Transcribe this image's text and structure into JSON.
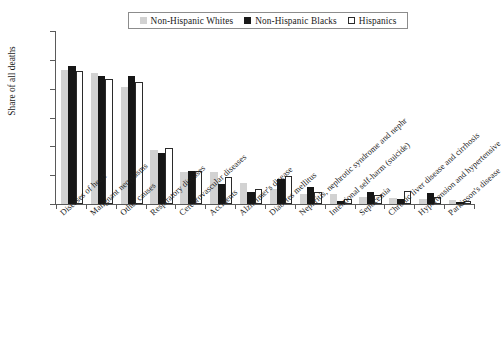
{
  "chart_data": {
    "type": "bar",
    "title": "",
    "xlabel": "",
    "ylabel": "Share of all deaths",
    "ylim": [
      0,
      0.3
    ],
    "yticks": [
      0,
      0.05,
      0.1,
      0.15,
      0.2,
      0.25,
      0.3
    ],
    "ytick_labels": [
      "0",
      "0.05",
      "0.1",
      "0.15",
      "0.2",
      "0.25",
      "0.3"
    ],
    "grid": false,
    "legend_position": "top-center",
    "categories": [
      "Diseases of heart",
      "Malignant neoplasms",
      "Other causes",
      "Respiratory diseases",
      "Cerebrovascular diseases",
      "Accidents",
      "Alzheimer's disease",
      "Diabetes mellitus",
      "Nephritis, nephrotic syndrome and nephr",
      "Intentional self-harm (suicide)",
      "Septicemia",
      "Chronic liver disease and cirrhosis",
      "Hypertension and hypertensive",
      "Parkinson's disease"
    ],
    "series": [
      {
        "name": "Non-Hispanic Whites",
        "color": "#d2d2d2",
        "values": [
          0.232,
          0.227,
          0.203,
          0.093,
          0.055,
          0.055,
          0.037,
          0.026,
          0.017,
          0.017,
          0.013,
          0.01,
          0.009,
          0.007
        ]
      },
      {
        "name": "Non-Hispanic Blacks",
        "color": "#161616",
        "values": [
          0.24,
          0.222,
          0.222,
          0.088,
          0.058,
          0.034,
          0.021,
          0.043,
          0.029,
          0.006,
          0.02,
          0.008,
          0.019,
          0.003
        ]
      },
      {
        "name": "Hispanics",
        "color": "#ffffff",
        "values": [
          0.23,
          0.217,
          0.212,
          0.098,
          0.057,
          0.046,
          0.026,
          0.049,
          0.02,
          0.009,
          0.015,
          0.022,
          0.013,
          0.005
        ]
      }
    ]
  },
  "legend": {
    "entries": [
      {
        "label": "Non-Hispanic Whites",
        "swatch": "filled-light-gray-square"
      },
      {
        "label": "Non-Hispanic Blacks",
        "swatch": "filled-black-square"
      },
      {
        "label": "Hispanics",
        "swatch": "outlined-white-square"
      }
    ]
  }
}
